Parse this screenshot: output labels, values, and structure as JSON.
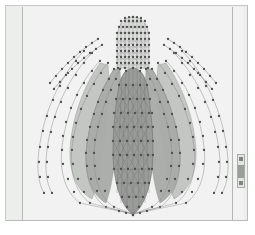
{
  "window": {
    "title": "",
    "background_color": "#ffffff",
    "frame_color": "#b9bcb9",
    "panel_color": "#eceeec"
  },
  "viewport": {
    "name": "3D mesh model viewport",
    "canvas_color": "#f1f2f1",
    "divider_color": "#b4b7b4",
    "width": 222,
    "height": 214
  },
  "scrollbar": {
    "name": "vertical scrollbar",
    "track_color": "#e3e5e3",
    "thumb_color": "#9b9e9b",
    "position_percent": 30
  },
  "model": {
    "name": "flower-bulb triangulated mesh",
    "node_color": "#4d4f4d",
    "edge_color": "#8c8e8c",
    "fill_dark": "#9a9c9a",
    "fill_mid": "#adafad",
    "fill_light": "#c9cbc9",
    "fill_pale": "#e2e4e2",
    "node_radius": 1.15,
    "components": [
      {
        "id": "capsule",
        "label": "top capsule mesh",
        "fill": "#d9dbd9",
        "rows": 11,
        "cols": 9
      },
      {
        "id": "center-petal",
        "label": "central teardrop petal",
        "fill": "#9a9c9a"
      },
      {
        "id": "inner-petal-left",
        "label": "inner left petal",
        "fill": "#a9aba9"
      },
      {
        "id": "inner-petal-right",
        "label": "inner right petal",
        "fill": "#a9aba9"
      },
      {
        "id": "mid-petal-left",
        "label": "mid left petal",
        "fill": "#bfc1bf"
      },
      {
        "id": "mid-petal-right",
        "label": "mid right petal",
        "fill": "#bfc1bf"
      },
      {
        "id": "outer-strand-left",
        "label": "outer left strand"
      },
      {
        "id": "outer-strand-right",
        "label": "outer right strand"
      },
      {
        "id": "detached-arc-left",
        "label": "detached upper-left arc"
      },
      {
        "id": "detached-arc-right",
        "label": "detached upper-right arc"
      }
    ]
  }
}
